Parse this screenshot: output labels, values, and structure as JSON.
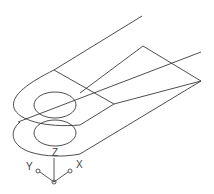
{
  "drawing": {
    "type": "isometric wireframe",
    "description": "Slotted link plate with hole, two-level extrusion",
    "stroke_color": "#3a3a3a",
    "background": "#ffffff"
  },
  "ucs_icon": {
    "z_label": "Z",
    "y_label": "Y",
    "x_label": "X"
  }
}
